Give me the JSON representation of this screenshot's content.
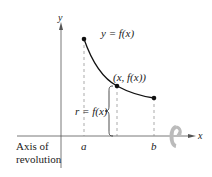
{
  "diagram": {
    "axis_labels": {
      "x": "x",
      "y": "y"
    },
    "curve_label": "y = f(x)",
    "point_label": "(x, f(x))",
    "radius_label": "r = f(x)",
    "tick_labels": {
      "a": "a",
      "b": "b"
    },
    "axis_of_revolution": {
      "line1": "Axis of",
      "line2": "revolution"
    },
    "colors": {
      "curve": "#111111",
      "axes": "#555555",
      "dashed": "#888888",
      "rotation_arrow": "#bbbbbb"
    }
  }
}
